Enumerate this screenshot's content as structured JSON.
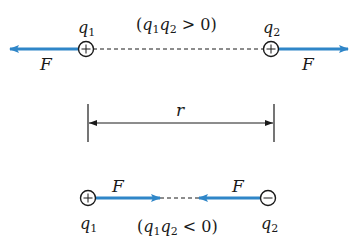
{
  "colors": {
    "force_arrow": "#2f86c8",
    "ink": "#1a1a1a",
    "background": "#ffffff"
  },
  "top": {
    "q1_label": "q",
    "q1_sub": "1",
    "q2_label": "q",
    "q2_sub": "2",
    "condition": {
      "open": "(",
      "a": "q",
      "a_sub": "1",
      "b": "q",
      "b_sub": "2",
      "rel": " > 0)"
    },
    "q1_sign": "+",
    "q2_sign": "+",
    "force_left_label": "F",
    "force_right_label": "F"
  },
  "distance": {
    "label": "r"
  },
  "bottom": {
    "q1_label": "q",
    "q1_sub": "1",
    "q2_label": "q",
    "q2_sub": "2",
    "condition": {
      "open": "(",
      "a": "q",
      "a_sub": "1",
      "b": "q",
      "b_sub": "2",
      "rel": " < 0)"
    },
    "q1_sign": "+",
    "q2_sign": "−",
    "force_left_label": "F",
    "force_right_label": "F"
  }
}
